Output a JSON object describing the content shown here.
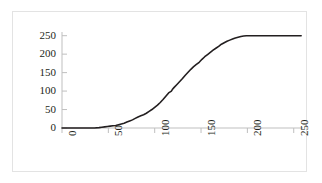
{
  "chart_data": {
    "type": "line",
    "title": "",
    "subtitle": "",
    "xlabel": "",
    "ylabel": "",
    "xlim": [
      0,
      260
    ],
    "ylim": [
      0,
      260
    ],
    "xticks": [
      0,
      50,
      100,
      150,
      200,
      250
    ],
    "xtick_labels": [
      "0",
      "50",
      "100",
      "150",
      "200",
      "250"
    ],
    "yticks": [
      0,
      50,
      100,
      150,
      200,
      250
    ],
    "ytick_labels": [
      "0",
      "50",
      "100",
      "150",
      "200",
      "250"
    ],
    "grid": false,
    "legend": null,
    "legend_position": "none",
    "xtick_rotation": 90,
    "series": [
      {
        "name": "cumulative-curve",
        "color": "#231f20",
        "line_width": 1.6,
        "x": [
          0,
          5,
          10,
          15,
          20,
          25,
          30,
          35,
          40,
          43,
          46,
          49,
          52,
          55,
          58,
          61,
          64,
          67,
          70,
          73,
          76,
          79,
          82,
          85,
          88,
          91,
          94,
          97,
          100,
          103,
          106,
          109,
          112,
          115,
          118,
          119,
          121,
          124,
          127,
          130,
          133,
          136,
          139,
          142,
          145,
          148,
          151,
          154,
          157,
          160,
          163,
          166,
          169,
          172,
          175,
          178,
          181,
          184,
          187,
          190,
          193,
          196,
          199,
          202,
          210,
          220,
          230,
          240,
          250,
          258
        ],
        "y": [
          0,
          0,
          0,
          0,
          0,
          0,
          0,
          0,
          1,
          2,
          3,
          4,
          5,
          6,
          7,
          9,
          11,
          13,
          16,
          19,
          22,
          26,
          30,
          33,
          36,
          40,
          45,
          50,
          56,
          62,
          69,
          77,
          86,
          95,
          100,
          104,
          110,
          118,
          126,
          134,
          143,
          151,
          159,
          166,
          172,
          178,
          186,
          193,
          199,
          205,
          211,
          216,
          221,
          227,
          231,
          235,
          238,
          241,
          244,
          246,
          248,
          249,
          250,
          250,
          250,
          250,
          250,
          250,
          250,
          250
        ]
      }
    ]
  },
  "axes": {
    "axis_color": "#bfbfbf",
    "tick_color": "#bfbfbf",
    "label_color": "#231f20",
    "border_color": "#e3e3e3",
    "plot_background": "#ffffff"
  }
}
